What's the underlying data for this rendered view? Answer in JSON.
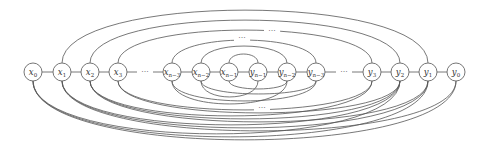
{
  "diagram": {
    "type": "graph",
    "node_radius": 9,
    "baseline_y": 72,
    "nodes": [
      {
        "id": "x0",
        "base": "x",
        "sub": "0",
        "x": 33
      },
      {
        "id": "x1",
        "base": "x",
        "sub": "1",
        "x": 62
      },
      {
        "id": "x2",
        "base": "x",
        "sub": "2",
        "x": 90
      },
      {
        "id": "x3",
        "base": "x",
        "sub": "3",
        "x": 118
      },
      {
        "id": "xn3",
        "base": "x",
        "sub": "n−3",
        "x": 172
      },
      {
        "id": "xn2",
        "base": "x",
        "sub": "n−2",
        "x": 201
      },
      {
        "id": "xn1",
        "base": "x",
        "sub": "n−1",
        "x": 229
      },
      {
        "id": "yn1",
        "base": "y",
        "sub": "n−1",
        "x": 258
      },
      {
        "id": "yn2",
        "base": "y",
        "sub": "n−2",
        "x": 287
      },
      {
        "id": "yn3",
        "base": "y",
        "sub": "n−3",
        "x": 316
      },
      {
        "id": "y3",
        "base": "y",
        "sub": "3",
        "x": 372
      },
      {
        "id": "y2",
        "base": "y",
        "sub": "2",
        "x": 400
      },
      {
        "id": "y1",
        "base": "y",
        "sub": "1",
        "x": 428
      },
      {
        "id": "y0",
        "base": "y",
        "sub": "0",
        "x": 456
      }
    ],
    "ellipsis_labels": [
      {
        "text": "···",
        "x": 145,
        "y": 74,
        "position": "chain-left"
      },
      {
        "text": "···",
        "x": 344,
        "y": 74,
        "position": "chain-right"
      },
      {
        "text": "···",
        "x": 242,
        "y": 40,
        "position": "top-inner"
      },
      {
        "text": "···",
        "x": 272,
        "y": 33,
        "position": "top-outer"
      },
      {
        "text": "···",
        "x": 262,
        "y": 110,
        "position": "bottom"
      }
    ],
    "top_arcs": [
      {
        "from": "x1",
        "to": "y1",
        "peak_y": 10
      },
      {
        "from": "x2",
        "to": "y2",
        "peak_y": 20
      },
      {
        "from": "x3",
        "to": "y3",
        "peak_y": 30
      },
      {
        "from": "xn3",
        "to": "yn3",
        "peak_y": 40
      },
      {
        "from": "xn2",
        "to": "yn2",
        "peak_y": 46
      },
      {
        "from": "xn1",
        "to": "yn1",
        "peak_y": 54
      }
    ],
    "chain_edges": [
      [
        "x0",
        "x1"
      ],
      [
        "x1",
        "x2"
      ],
      [
        "x2",
        "x3"
      ],
      [
        "x3",
        "dotsL"
      ],
      [
        "dotsL",
        "xn3"
      ],
      [
        "xn3",
        "xn2"
      ],
      [
        "xn2",
        "xn1"
      ],
      [
        "xn1",
        "yn1"
      ],
      [
        "yn1",
        "yn2"
      ],
      [
        "yn2",
        "yn3"
      ],
      [
        "yn3",
        "dotsR"
      ],
      [
        "dotsR",
        "y3"
      ],
      [
        "y3",
        "y2"
      ],
      [
        "y2",
        "y1"
      ],
      [
        "y1",
        "y0"
      ]
    ],
    "bottom_arcs": [
      {
        "from": "x0",
        "to": "y0",
        "peak_y": 140
      },
      {
        "from": "x0",
        "to": "y1",
        "peak_y": 137
      },
      {
        "from": "x0",
        "to": "y2",
        "peak_y": 134
      },
      {
        "from": "x1",
        "to": "y0",
        "peak_y": 131
      },
      {
        "from": "x1",
        "to": "y1",
        "peak_y": 128
      },
      {
        "from": "x1",
        "to": "y2",
        "peak_y": 125
      },
      {
        "from": "x2",
        "to": "y1",
        "peak_y": 122
      },
      {
        "from": "x2",
        "to": "y2",
        "peak_y": 119
      },
      {
        "from": "x2",
        "to": "y3",
        "peak_y": 116
      },
      {
        "from": "x3",
        "to": "y2",
        "peak_y": 113
      },
      {
        "from": "x3",
        "to": "y3",
        "peak_y": 110
      },
      {
        "from": "xn3",
        "to": "yn2",
        "peak_y": 104
      },
      {
        "from": "xn3",
        "to": "yn3",
        "peak_y": 101
      },
      {
        "from": "xn2",
        "to": "yn1",
        "peak_y": 97
      },
      {
        "from": "xn2",
        "to": "yn3",
        "peak_y": 94
      },
      {
        "from": "xn1",
        "to": "yn2",
        "peak_y": 89
      }
    ]
  }
}
